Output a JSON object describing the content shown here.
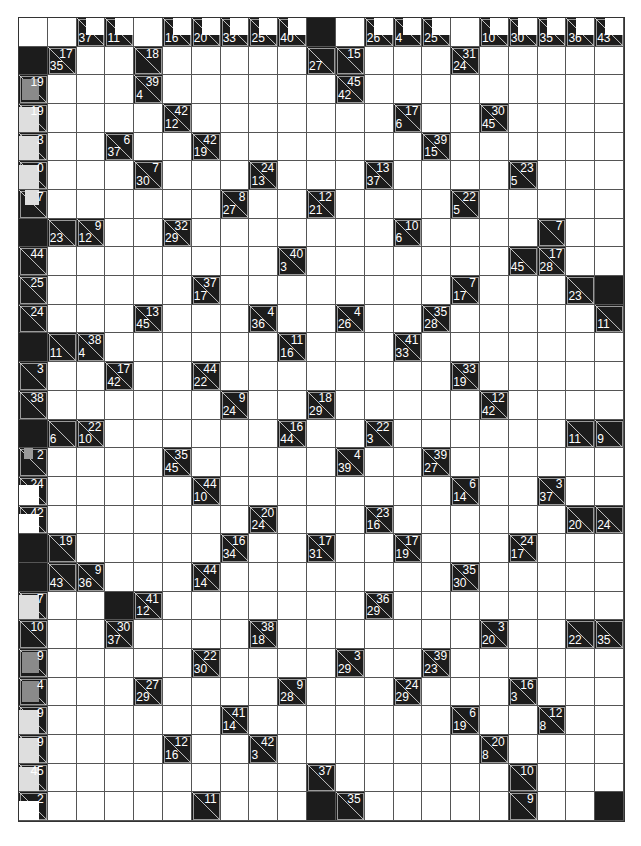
{
  "puzzle": {
    "type": "kakuro",
    "columns": 21,
    "rows": 28,
    "colors": {
      "block": "#1c1c1c",
      "entry": "#ffffff",
      "grid_line": "#555555",
      "clue_text": "#ffffff",
      "overlay_grey": "#8a8a8a",
      "overlay_light": "#dedede"
    },
    "header_row_clues": [
      {
        "col": 2,
        "down": "37"
      },
      {
        "col": 3,
        "down": "11"
      },
      {
        "col": 5,
        "down": "16"
      },
      {
        "col": 6,
        "down": "20"
      },
      {
        "col": 7,
        "down": "33"
      },
      {
        "col": 8,
        "down": "25"
      },
      {
        "col": 9,
        "down": "40"
      },
      {
        "col": 12,
        "down": "26"
      },
      {
        "col": 13,
        "down": "4"
      },
      {
        "col": 14,
        "down": "25"
      },
      {
        "col": 16,
        "down": "10"
      },
      {
        "col": 17,
        "down": "30"
      },
      {
        "col": 18,
        "down": "35"
      },
      {
        "col": 19,
        "down": "36"
      },
      {
        "col": 20,
        "down": "43"
      }
    ],
    "header_row_blocks": [
      10
    ],
    "blocks": [
      [
        1,
        0
      ],
      [
        7,
        0
      ],
      [
        11,
        0
      ],
      [
        14,
        0
      ],
      [
        18,
        0
      ],
      [
        19,
        0
      ],
      [
        9,
        20
      ],
      [
        20,
        3
      ],
      [
        27,
        10
      ],
      [
        27,
        20
      ]
    ],
    "clues": [
      {
        "r": 1,
        "c": 1,
        "across": "17",
        "down": "35"
      },
      {
        "r": 1,
        "c": 4,
        "across": "18",
        "down": ""
      },
      {
        "r": 1,
        "c": 10,
        "across": "",
        "down": "27"
      },
      {
        "r": 1,
        "c": 11,
        "across": "15",
        "down": ""
      },
      {
        "r": 1,
        "c": 15,
        "across": "31",
        "down": "24"
      },
      {
        "r": 2,
        "c": 0,
        "across": "19",
        "down": "",
        "overlay": "grey"
      },
      {
        "r": 2,
        "c": 4,
        "across": "39",
        "down": "4"
      },
      {
        "r": 2,
        "c": 11,
        "across": "45",
        "down": "42"
      },
      {
        "r": 3,
        "c": 0,
        "across": "19",
        "down": "",
        "overlay": "light"
      },
      {
        "r": 3,
        "c": 5,
        "across": "42",
        "down": "12"
      },
      {
        "r": 3,
        "c": 13,
        "across": "17",
        "down": "6"
      },
      {
        "r": 3,
        "c": 16,
        "across": "30",
        "down": "45"
      },
      {
        "r": 4,
        "c": 0,
        "across": "3",
        "down": "",
        "overlay": "light"
      },
      {
        "r": 4,
        "c": 3,
        "across": "6",
        "down": "37"
      },
      {
        "r": 4,
        "c": 6,
        "across": "42",
        "down": "19"
      },
      {
        "r": 4,
        "c": 14,
        "across": "39",
        "down": "15"
      },
      {
        "r": 5,
        "c": 0,
        "across": "0",
        "down": "",
        "overlay": "light"
      },
      {
        "r": 5,
        "c": 4,
        "across": "7",
        "down": "30"
      },
      {
        "r": 5,
        "c": 8,
        "across": "24",
        "down": "13"
      },
      {
        "r": 5,
        "c": 12,
        "across": "13",
        "down": "37"
      },
      {
        "r": 5,
        "c": 17,
        "across": "23",
        "down": "5"
      },
      {
        "r": 6,
        "c": 0,
        "across": "7",
        "down": "",
        "overlay": "light-top"
      },
      {
        "r": 6,
        "c": 7,
        "across": "8",
        "down": "27"
      },
      {
        "r": 6,
        "c": 10,
        "across": "12",
        "down": "21"
      },
      {
        "r": 6,
        "c": 15,
        "across": "22",
        "down": "5"
      },
      {
        "r": 7,
        "c": 1,
        "across": "",
        "down": "23"
      },
      {
        "r": 7,
        "c": 2,
        "across": "9",
        "down": "12"
      },
      {
        "r": 7,
        "c": 5,
        "across": "32",
        "down": "29"
      },
      {
        "r": 7,
        "c": 13,
        "across": "10",
        "down": "6"
      },
      {
        "r": 7,
        "c": 18,
        "across": "7",
        "down": ""
      },
      {
        "r": 8,
        "c": 0,
        "across": "44",
        "down": ""
      },
      {
        "r": 8,
        "c": 9,
        "across": "40",
        "down": "3"
      },
      {
        "r": 8,
        "c": 17,
        "across": "",
        "down": "45"
      },
      {
        "r": 8,
        "c": 18,
        "across": "17",
        "down": "28"
      },
      {
        "r": 9,
        "c": 0,
        "across": "25",
        "down": ""
      },
      {
        "r": 9,
        "c": 6,
        "across": "37",
        "down": "17"
      },
      {
        "r": 9,
        "c": 15,
        "across": "7",
        "down": "17"
      },
      {
        "r": 9,
        "c": 19,
        "across": "",
        "down": "23"
      },
      {
        "r": 10,
        "c": 0,
        "across": "24",
        "down": ""
      },
      {
        "r": 10,
        "c": 4,
        "across": "13",
        "down": "45"
      },
      {
        "r": 10,
        "c": 8,
        "across": "4",
        "down": "36"
      },
      {
        "r": 10,
        "c": 11,
        "across": "4",
        "down": "26"
      },
      {
        "r": 10,
        "c": 14,
        "across": "35",
        "down": "28"
      },
      {
        "r": 10,
        "c": 20,
        "across": "",
        "down": "11"
      },
      {
        "r": 11,
        "c": 1,
        "across": "",
        "down": "11"
      },
      {
        "r": 11,
        "c": 2,
        "across": "38",
        "down": "4"
      },
      {
        "r": 11,
        "c": 9,
        "across": "11",
        "down": "16"
      },
      {
        "r": 11,
        "c": 13,
        "across": "41",
        "down": "33"
      },
      {
        "r": 12,
        "c": 0,
        "across": "3",
        "down": ""
      },
      {
        "r": 12,
        "c": 3,
        "across": "17",
        "down": "42"
      },
      {
        "r": 12,
        "c": 6,
        "across": "44",
        "down": "22"
      },
      {
        "r": 12,
        "c": 15,
        "across": "33",
        "down": "19"
      },
      {
        "r": 13,
        "c": 0,
        "across": "38",
        "down": ""
      },
      {
        "r": 13,
        "c": 7,
        "across": "9",
        "down": "24"
      },
      {
        "r": 13,
        "c": 10,
        "across": "18",
        "down": "29"
      },
      {
        "r": 13,
        "c": 16,
        "across": "12",
        "down": "42"
      },
      {
        "r": 14,
        "c": 1,
        "across": "",
        "down": "6"
      },
      {
        "r": 14,
        "c": 2,
        "across": "22",
        "down": "10"
      },
      {
        "r": 14,
        "c": 9,
        "across": "16",
        "down": "44"
      },
      {
        "r": 14,
        "c": 12,
        "across": "22",
        "down": "3"
      },
      {
        "r": 14,
        "c": 19,
        "across": "",
        "down": "11"
      },
      {
        "r": 14,
        "c": 20,
        "across": "",
        "down": "9"
      },
      {
        "r": 15,
        "c": 0,
        "across": "2",
        "down": "",
        "overlay": "grey-small"
      },
      {
        "r": 15,
        "c": 5,
        "across": "35",
        "down": "45"
      },
      {
        "r": 15,
        "c": 11,
        "across": "4",
        "down": "39"
      },
      {
        "r": 15,
        "c": 14,
        "across": "39",
        "down": "27"
      },
      {
        "r": 16,
        "c": 0,
        "across": "24",
        "down": "",
        "overlay": "white-bottom"
      },
      {
        "r": 16,
        "c": 6,
        "across": "44",
        "down": "10"
      },
      {
        "r": 16,
        "c": 15,
        "across": "6",
        "down": "14"
      },
      {
        "r": 16,
        "c": 18,
        "across": "3",
        "down": "37"
      },
      {
        "r": 17,
        "c": 0,
        "across": "42",
        "down": "",
        "overlay": "white-bottom"
      },
      {
        "r": 17,
        "c": 8,
        "across": "20",
        "down": "24"
      },
      {
        "r": 17,
        "c": 12,
        "across": "23",
        "down": "16"
      },
      {
        "r": 17,
        "c": 19,
        "across": "",
        "down": "20"
      },
      {
        "r": 17,
        "c": 20,
        "across": "",
        "down": "24"
      },
      {
        "r": 18,
        "c": 1,
        "across": "19",
        "down": ""
      },
      {
        "r": 18,
        "c": 7,
        "across": "16",
        "down": "34"
      },
      {
        "r": 18,
        "c": 10,
        "across": "17",
        "down": "31"
      },
      {
        "r": 18,
        "c": 13,
        "across": "17",
        "down": "19"
      },
      {
        "r": 18,
        "c": 17,
        "across": "24",
        "down": "17"
      },
      {
        "r": 19,
        "c": 1,
        "across": "",
        "down": "43"
      },
      {
        "r": 19,
        "c": 2,
        "across": "9",
        "down": "36"
      },
      {
        "r": 19,
        "c": 6,
        "across": "44",
        "down": "14"
      },
      {
        "r": 19,
        "c": 15,
        "across": "35",
        "down": "30"
      },
      {
        "r": 20,
        "c": 0,
        "across": "7",
        "down": "",
        "overlay": "light"
      },
      {
        "r": 20,
        "c": 4,
        "across": "41",
        "down": "12"
      },
      {
        "r": 20,
        "c": 12,
        "across": "36",
        "down": "29"
      },
      {
        "r": 21,
        "c": 0,
        "across": "10",
        "down": ""
      },
      {
        "r": 21,
        "c": 3,
        "across": "30",
        "down": "37"
      },
      {
        "r": 21,
        "c": 8,
        "across": "38",
        "down": "18"
      },
      {
        "r": 21,
        "c": 16,
        "across": "3",
        "down": "20"
      },
      {
        "r": 21,
        "c": 19,
        "across": "",
        "down": "22"
      },
      {
        "r": 21,
        "c": 20,
        "across": "",
        "down": "35"
      },
      {
        "r": 22,
        "c": 0,
        "across": "9",
        "down": "",
        "overlay": "grey"
      },
      {
        "r": 22,
        "c": 6,
        "across": "22",
        "down": "30"
      },
      {
        "r": 22,
        "c": 11,
        "across": "3",
        "down": "29"
      },
      {
        "r": 22,
        "c": 14,
        "across": "39",
        "down": "23"
      },
      {
        "r": 23,
        "c": 0,
        "across": "4",
        "down": "",
        "overlay": "grey"
      },
      {
        "r": 23,
        "c": 4,
        "across": "27",
        "down": "29"
      },
      {
        "r": 23,
        "c": 9,
        "across": "9",
        "down": "28"
      },
      {
        "r": 23,
        "c": 13,
        "across": "24",
        "down": "29"
      },
      {
        "r": 23,
        "c": 17,
        "across": "16",
        "down": "3"
      },
      {
        "r": 24,
        "c": 0,
        "across": "9",
        "down": "",
        "overlay": "light"
      },
      {
        "r": 24,
        "c": 7,
        "across": "41",
        "down": "14"
      },
      {
        "r": 24,
        "c": 15,
        "across": "6",
        "down": "19"
      },
      {
        "r": 24,
        "c": 18,
        "across": "12",
        "down": "8"
      },
      {
        "r": 25,
        "c": 0,
        "across": "9",
        "down": "",
        "overlay": "light"
      },
      {
        "r": 25,
        "c": 5,
        "across": "12",
        "down": "16"
      },
      {
        "r": 25,
        "c": 8,
        "across": "42",
        "down": "3"
      },
      {
        "r": 25,
        "c": 16,
        "across": "20",
        "down": "8"
      },
      {
        "r": 26,
        "c": 0,
        "across": "45",
        "down": "",
        "overlay": "light"
      },
      {
        "r": 26,
        "c": 10,
        "across": "37",
        "down": ""
      },
      {
        "r": 26,
        "c": 17,
        "across": "10",
        "down": ""
      },
      {
        "r": 27,
        "c": 0,
        "across": "2",
        "down": "",
        "overlay": "white-bottom"
      },
      {
        "r": 27,
        "c": 6,
        "across": "11",
        "down": ""
      },
      {
        "r": 27,
        "c": 11,
        "across": "35",
        "down": ""
      },
      {
        "r": 27,
        "c": 17,
        "across": "9",
        "down": ""
      }
    ]
  }
}
